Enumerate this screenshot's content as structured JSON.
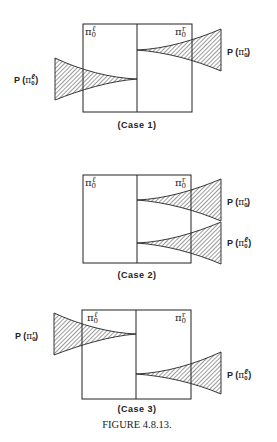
{
  "figure": {
    "caption": "FIGURE 4.8.13.",
    "cases": [
      {
        "label": "(Case 1)",
        "left_region": {
          "symbol": "π",
          "sub": "0",
          "sup": "ℓ"
        },
        "right_region": {
          "symbol": "π",
          "sub": "0",
          "sup": "r"
        },
        "distributions": [
          {
            "label_prefix": "P (",
            "symbol": "π",
            "sub": "0",
            "sup": "ℓ",
            "label_suffix": ")",
            "side": "left"
          },
          {
            "label_prefix": "P (",
            "symbol": "π",
            "sub": "0",
            "sup": "r",
            "label_suffix": ")",
            "side": "right"
          }
        ]
      },
      {
        "label": "(Case 2)",
        "left_region": {
          "symbol": "π",
          "sub": "0",
          "sup": "ℓ"
        },
        "right_region": {
          "symbol": "π",
          "sub": "0",
          "sup": "r"
        },
        "distributions": [
          {
            "label_prefix": "P (",
            "symbol": "π",
            "sub": "0",
            "sup": "r",
            "label_suffix": ")",
            "side": "right"
          },
          {
            "label_prefix": "P (",
            "symbol": "π",
            "sub": "0",
            "sup": "ℓ",
            "label_suffix": ")",
            "side": "right"
          }
        ]
      },
      {
        "label": "(Case 3)",
        "left_region": {
          "symbol": "π",
          "sub": "0",
          "sup": "ℓ"
        },
        "right_region": {
          "symbol": "π",
          "sub": "0",
          "sup": "r"
        },
        "distributions": [
          {
            "label_prefix": "P (",
            "symbol": "π",
            "sub": "0",
            "sup": "r",
            "label_suffix": ")",
            "side": "left"
          },
          {
            "label_prefix": "P (",
            "symbol": "π",
            "sub": "0",
            "sup": "ℓ",
            "label_suffix": ")",
            "side": "right"
          }
        ]
      }
    ]
  },
  "colors": {
    "ink": "#222222",
    "background": "#ffffff"
  }
}
